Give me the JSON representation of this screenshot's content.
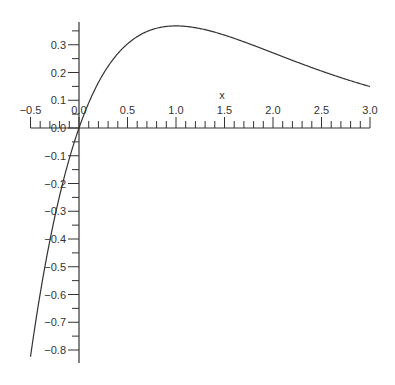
{
  "chart_data": {
    "type": "line",
    "title": "",
    "xlabel": "x",
    "ylabel": "",
    "function": "x*exp(-x)",
    "xlim": [
      -0.5,
      3.0
    ],
    "ylim": [
      -0.82,
      0.38
    ],
    "grid": false,
    "legend": null,
    "x_ticks": [
      "-0.5",
      "0.0",
      "0.5",
      "1.0",
      "1.5",
      "2.0",
      "2.5",
      "3.0"
    ],
    "y_ticks": [
      "0.3",
      "0.2",
      "0.1",
      "0.0",
      "-0.1",
      "-0.2",
      "-0.3",
      "-0.4",
      "-0.5",
      "-0.6",
      "-0.7",
      "-0.8"
    ],
    "series": [
      {
        "name": "f(x)",
        "x": [
          -0.5,
          -0.4,
          -0.3,
          -0.2,
          -0.1,
          0.0,
          0.25,
          0.5,
          0.75,
          1.0,
          1.25,
          1.5,
          1.75,
          2.0,
          2.25,
          2.5,
          2.75,
          3.0
        ],
        "values": [
          -0.824,
          -0.597,
          -0.405,
          -0.244,
          -0.111,
          0.0,
          0.195,
          0.303,
          0.354,
          0.368,
          0.358,
          0.335,
          0.304,
          0.271,
          0.237,
          0.205,
          0.175,
          0.149
        ]
      }
    ],
    "colors": {
      "axis": "#333333",
      "line": "#333333"
    }
  }
}
